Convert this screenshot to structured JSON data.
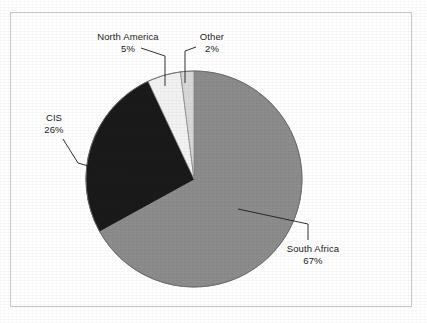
{
  "chart_data": {
    "type": "pie",
    "title": "",
    "subtitle": "",
    "xlabel": "",
    "ylabel": "",
    "legend_position": "none",
    "grid": false,
    "labels_show_percent": true,
    "start_angle_deg": 0,
    "direction": "clockwise",
    "categories": [
      "South Africa",
      "CIS",
      "North America",
      "Other"
    ],
    "values": [
      67,
      26,
      5,
      2
    ],
    "unit": "%",
    "slices": [
      {
        "label": "South Africa",
        "percent": 67,
        "percent_text": "67%",
        "color": "#8c8c8c",
        "start_deg": 0,
        "end_deg": 241.2,
        "label_position": "right-bottom",
        "has_leader_line": true
      },
      {
        "label": "CIS",
        "percent": 26,
        "percent_text": "26%",
        "color": "#1a1a1a",
        "start_deg": 241.2,
        "end_deg": 334.8,
        "label_position": "left",
        "has_leader_line": true
      },
      {
        "label": "North America",
        "percent": 5,
        "percent_text": "5%",
        "color": "#f2f2f2",
        "start_deg": 334.8,
        "end_deg": 352.8,
        "label_position": "top-left",
        "has_leader_line": true
      },
      {
        "label": "Other",
        "percent": 2,
        "percent_text": "2%",
        "color": "#d8d8d8",
        "start_deg": 352.8,
        "end_deg": 360,
        "label_position": "top-right",
        "has_leader_line": true
      }
    ]
  },
  "figure": {
    "border_color": "#c8c8c8",
    "background_color": "#ffffff",
    "outline_color": "#5a5a5a",
    "leader_line_color": "#1c1c1c"
  }
}
